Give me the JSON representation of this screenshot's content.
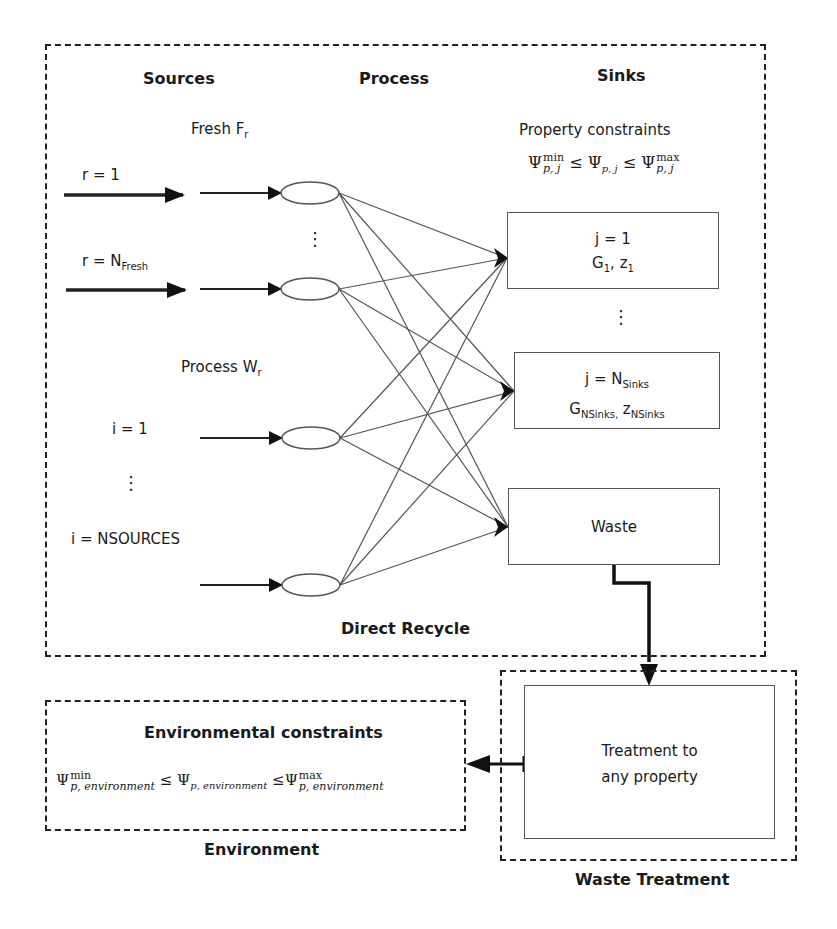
{
  "diagram": {
    "main_box": {
      "column_headers": {
        "sources": "Sources",
        "process": "Process",
        "sinks": "Sinks"
      },
      "fresh_label": "Fresh F",
      "fresh_sub": "r",
      "fresh_sources": [
        {
          "label": "r = 1"
        },
        {
          "label": "r = N",
          "sub": "Fresh"
        }
      ],
      "process_label": "Process W",
      "process_sub": "r",
      "process_sources": [
        {
          "label": "i = 1"
        },
        {
          "label": "i = NSOURCES"
        }
      ],
      "ellipsis": "⋮",
      "property_constraints": {
        "title": "Property constraints",
        "psi": "Ψ",
        "leq": "≤",
        "min": "min",
        "max": "max",
        "sub": "p, j"
      },
      "sinks": [
        {
          "line1": "j = 1",
          "line2_g": "G",
          "line2_g_sub": "1",
          "line2_z": "z",
          "line2_z_sub": "1"
        },
        {
          "line1": "j = N",
          "line1_sub": "Sinks",
          "line2_g": "G",
          "line2_g_sub": "NSinks,",
          "line2_z": "z",
          "line2_z_sub": "NSinks"
        },
        {
          "line1": "Waste"
        }
      ],
      "footer": "Direct Recycle"
    },
    "environment_box": {
      "title": "Environmental constraints",
      "psi": "Ψ",
      "leq": "≤",
      "min": "min",
      "max": "max",
      "sub": "p, environment",
      "footer": "Environment"
    },
    "waste_treatment_box": {
      "inner_line1": "Treatment to",
      "inner_line2": "any property",
      "footer": "Waste Treatment"
    }
  },
  "colors": {
    "line": "#222222",
    "thin_line": "#555555",
    "background": "#ffffff"
  }
}
